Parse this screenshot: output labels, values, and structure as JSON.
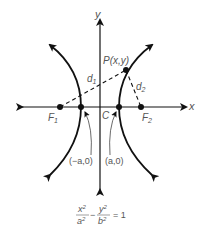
{
  "diagram": {
    "axes": {
      "x_label": "x",
      "y_label": "y"
    },
    "points": {
      "P": "P(x,y)",
      "F1": "F",
      "F1_sub": "1",
      "F2": "F",
      "F2_sub": "2",
      "C": "C"
    },
    "distances": {
      "d1": "d",
      "d1_sub": "1",
      "d2": "d",
      "d2_sub": "2"
    },
    "vertices": {
      "left": "(−a,0)",
      "right": "(a,0)"
    },
    "equation": {
      "x_num": "x",
      "x_exp": "2",
      "a_den": "a",
      "a_exp": "2",
      "minus": "−",
      "y_num": "y",
      "y_exp": "2",
      "b_den": "b",
      "b_exp": "2",
      "equals": "= 1"
    },
    "colors": {
      "curve": "#111111",
      "label": "#555555"
    }
  }
}
